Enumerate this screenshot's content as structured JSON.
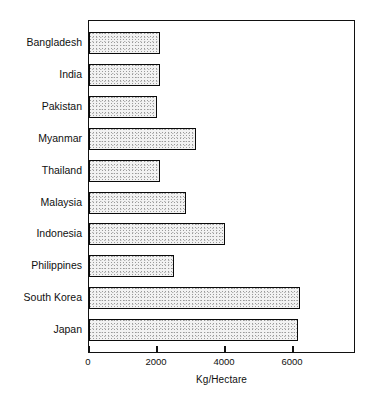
{
  "chart_data": {
    "type": "bar",
    "orientation": "horizontal",
    "title": "",
    "subtitle": "",
    "xlabel": "Kg/Hectare",
    "ylabel": "",
    "categories": [
      "Bangladesh",
      "India",
      "Pakistan",
      "Myanmar",
      "Thailand",
      "Malaysia",
      "Indonesia",
      "Philippines",
      "South Korea",
      "Japan"
    ],
    "values": [
      2100,
      2100,
      2000,
      3150,
      2080,
      2850,
      4000,
      2500,
      6200,
      6150
    ],
    "xlim": [
      0,
      7850
    ],
    "xticks": [
      0,
      2000,
      4000,
      6000
    ],
    "xtick_labels": [
      "0",
      "2000",
      "4000",
      "6000"
    ],
    "grid": false,
    "legend": null,
    "series": [
      {
        "name": "Yield",
        "values": [
          2100,
          2100,
          2000,
          3150,
          2080,
          2850,
          4000,
          2500,
          6200,
          6150
        ]
      }
    ],
    "bar_fill": "#f2f2f2",
    "bar_edge": "#0a0a0a",
    "axis_color": "#111111"
  },
  "axis": {
    "x_title": "Kg/Hectare"
  }
}
